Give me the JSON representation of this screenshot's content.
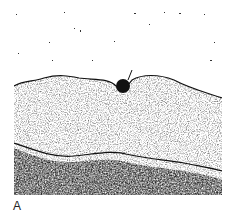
{
  "figure": {
    "panel_label": "A",
    "colors": {
      "background": "#ffffff",
      "dark_stain": "#111111",
      "mid_stain": "#555555"
    }
  }
}
